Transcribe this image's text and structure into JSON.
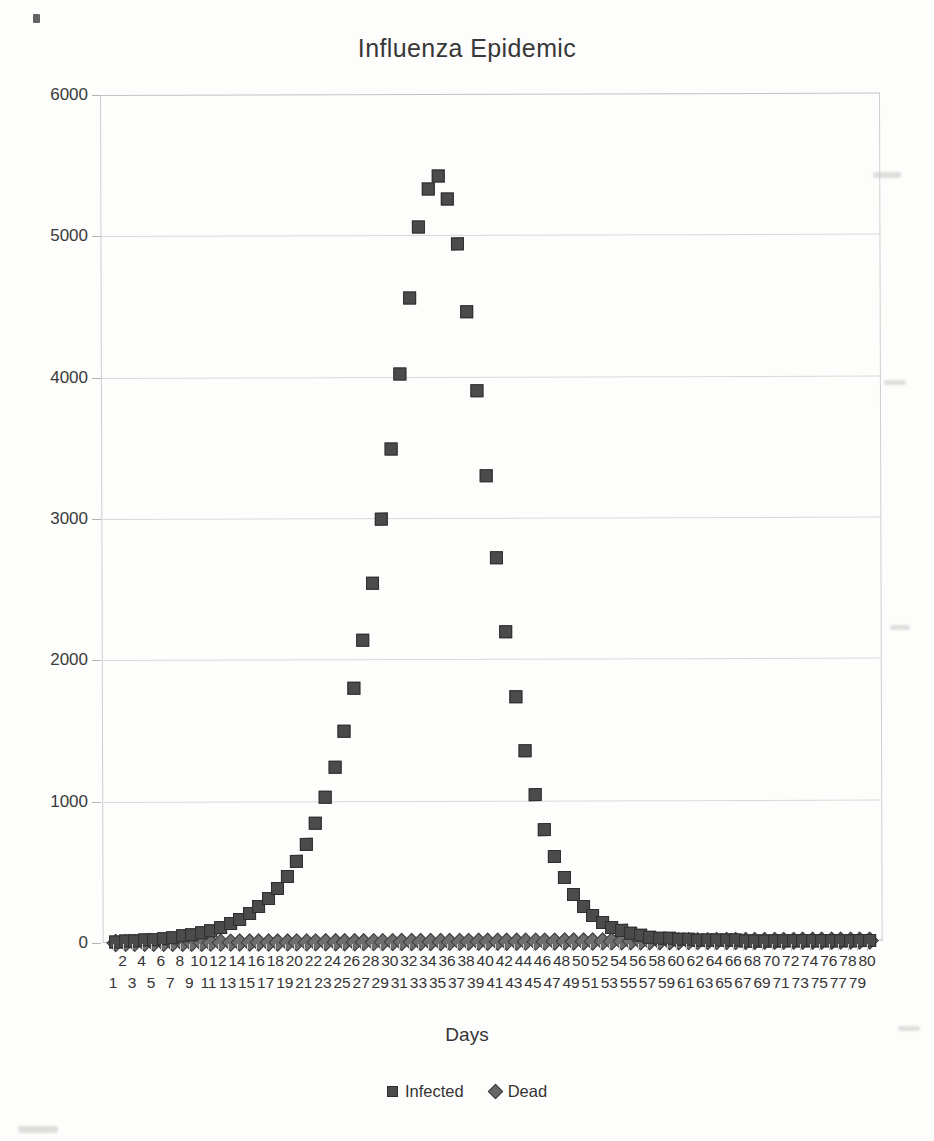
{
  "chart_data": {
    "type": "scatter",
    "title": "Influenza Epidemic",
    "xlabel": "Days",
    "ylabel": "",
    "xlim": [
      1,
      80
    ],
    "ylim": [
      0,
      6000
    ],
    "grid": true,
    "legend_position": "bottom",
    "ytick_labels": [
      "0",
      "1000",
      "2000",
      "3000",
      "4000",
      "5000",
      "6000"
    ],
    "ytick_values": [
      0,
      1000,
      2000,
      3000,
      4000,
      5000,
      6000
    ],
    "x": [
      1,
      2,
      3,
      4,
      5,
      6,
      7,
      8,
      9,
      10,
      11,
      12,
      13,
      14,
      15,
      16,
      17,
      18,
      19,
      20,
      21,
      22,
      23,
      24,
      25,
      26,
      27,
      28,
      29,
      30,
      31,
      32,
      33,
      34,
      35,
      36,
      37,
      38,
      39,
      40,
      41,
      42,
      43,
      44,
      45,
      46,
      47,
      48,
      49,
      50,
      51,
      52,
      53,
      54,
      55,
      56,
      57,
      58,
      59,
      60,
      61,
      62,
      63,
      64,
      65,
      66,
      67,
      68,
      69,
      70,
      71,
      72,
      73,
      74,
      75,
      76,
      77,
      78,
      79,
      80
    ],
    "xtick_labels_even_row": [
      "2",
      "4",
      "6",
      "8",
      "10",
      "12",
      "14",
      "16",
      "18",
      "20",
      "22",
      "24",
      "26",
      "28",
      "30",
      "32",
      "34",
      "36",
      "38",
      "40",
      "42",
      "44",
      "46",
      "48",
      "50",
      "52",
      "54",
      "56",
      "58",
      "60",
      "62",
      "64",
      "66",
      "68",
      "70",
      "72",
      "74",
      "76",
      "78",
      "80"
    ],
    "xtick_labels_odd_row": [
      "1",
      "3",
      "5",
      "7",
      "9",
      "11",
      "13",
      "15",
      "17",
      "19",
      "21",
      "23",
      "25",
      "27",
      "29",
      "31",
      "33",
      "35",
      "37",
      "39",
      "41",
      "43",
      "45",
      "47",
      "49",
      "51",
      "53",
      "55",
      "57",
      "59",
      "61",
      "63",
      "65",
      "67",
      "69",
      "71",
      "73",
      "75",
      "77",
      "79"
    ],
    "series": [
      {
        "name": "Infected",
        "marker": "square",
        "color": "#4b4b4b",
        "values": [
          10,
          12,
          15,
          19,
          24,
          30,
          37,
          46,
          57,
          71,
          88,
          109,
          135,
          166,
          205,
          252,
          310,
          380,
          466,
          570,
          695,
          845,
          1025,
          1240,
          1495,
          1795,
          2140,
          2540,
          2990,
          3490,
          4020,
          4560,
          5060,
          5330,
          5420,
          5260,
          4940,
          4460,
          3900,
          3300,
          2720,
          2190,
          1730,
          1350,
          1040,
          790,
          600,
          450,
          335,
          250,
          185,
          137,
          101,
          75,
          56,
          42,
          31,
          24,
          18,
          14,
          11,
          9,
          7,
          6,
          5,
          4,
          3,
          3,
          2,
          2,
          2,
          1,
          1,
          1,
          1,
          1,
          1,
          1,
          1,
          1
        ]
      },
      {
        "name": "Dead",
        "marker": "diamond",
        "color": "#6e6e6e",
        "values": [
          0,
          0,
          0,
          1,
          1,
          2,
          2,
          3,
          4,
          5,
          7,
          9,
          11,
          14,
          18,
          22,
          27,
          34,
          42,
          52,
          64,
          79,
          98,
          121,
          149,
          183,
          225,
          277,
          340,
          417,
          511,
          625,
          762,
          925,
          1118,
          1340,
          1590,
          1860,
          2140,
          2420,
          2690,
          2930,
          3150,
          3340,
          3500,
          3630,
          3740,
          3830,
          3900,
          3960,
          4010,
          4050,
          4080,
          4100,
          4120,
          4140,
          4155,
          4165,
          4175,
          4182,
          4188,
          4193,
          4197,
          4200,
          4203,
          4205,
          4207,
          4209,
          4210,
          4211,
          4212,
          4213,
          4214,
          4215,
          4216,
          4217,
          4218,
          4219,
          4220,
          4221
        ]
      }
    ],
    "plotted_dead_baseline_note": "Dead series plotted near zero on this axis"
  },
  "legend": {
    "entries": [
      {
        "label": "Infected",
        "marker": "square"
      },
      {
        "label": "Dead",
        "marker": "diamond"
      }
    ]
  }
}
